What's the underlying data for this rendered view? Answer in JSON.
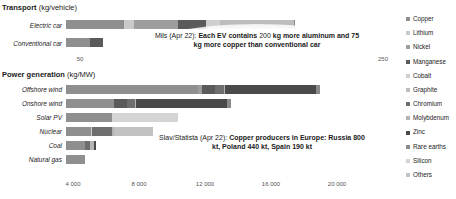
{
  "transport": {
    "title": "Transport",
    "unit": "(kg/vehicle)",
    "categories": [
      "Electric car",
      "Conventional car"
    ],
    "ticks": [
      "50",
      "250"
    ],
    "annotation": {
      "source": "Mils (Apr 22): ",
      "bold1": "Each EV contains ",
      "plain1": "200",
      "bold2": "kg more aluminum and 75 kg more copper than conventional car"
    }
  },
  "power": {
    "title": "Power generation",
    "unit": "(kg/MW)",
    "categories": [
      "Offshore wind",
      "Onshore wind",
      "Solar PV",
      "Nuclear",
      "Coal",
      "Natural gas"
    ],
    "ticks": [
      "4 000",
      "8 000",
      "12 000",
      "16 000",
      "20 000"
    ],
    "annotation": {
      "source": "Slav/Statista (Apr 22): ",
      "bold1": "Copper producers in Europe: Russia 800 kt, Poland 440 kt, Spain 190 kt"
    }
  },
  "legend": {
    "items": [
      {
        "label": "Copper",
        "color": "#8f8f8f"
      },
      {
        "label": "Lithium",
        "color": "#c9c9c9"
      },
      {
        "label": "Nickel",
        "color": "#9d9d9d"
      },
      {
        "label": "Manganese",
        "color": "#5a5a5a"
      },
      {
        "label": "Cobalt",
        "color": "#cfcfcf"
      },
      {
        "label": "Graphite",
        "color": "#bdbdbd"
      },
      {
        "label": "Chromium",
        "color": "#6e6e6e"
      },
      {
        "label": "Molybdenum",
        "color": "#b4b4b4"
      },
      {
        "label": "Zinc",
        "color": "#4a4a4a"
      },
      {
        "label": "Rare earths",
        "color": "#8a8a8a"
      },
      {
        "label": "Silicon",
        "color": "#d4d4d4"
      },
      {
        "label": "Others",
        "color": "#c2c2c2"
      }
    ]
  },
  "chart_data": {
    "type": "bar",
    "subtype": "stacked-horizontal",
    "grid": false,
    "legend_position": "right",
    "series_names": [
      "Copper",
      "Lithium",
      "Nickel",
      "Manganese",
      "Cobalt",
      "Graphite",
      "Chromium",
      "Molybdenum",
      "Zinc",
      "Rare earths",
      "Silicon",
      "Others"
    ],
    "panels": [
      {
        "title": "Transport",
        "ylabel": "",
        "xlabel": "kg/vehicle",
        "xlim": [
          0,
          300
        ],
        "xticks": [
          50,
          250
        ],
        "categories": [
          "Electric car",
          "Conventional car"
        ],
        "rows": [
          {
            "category": "Electric car",
            "total": 208,
            "segments": [
              {
                "name": "Copper",
                "value": 53
              },
              {
                "name": "Lithium",
                "value": 9
              },
              {
                "name": "Nickel",
                "value": 40
              },
              {
                "name": "Manganese",
                "value": 25
              },
              {
                "name": "Cobalt",
                "value": 13
              },
              {
                "name": "Graphite",
                "value": 67
              },
              {
                "name": "Rare earths",
                "value": 1
              }
            ]
          },
          {
            "category": "Conventional car",
            "total": 34,
            "segments": [
              {
                "name": "Copper",
                "value": 22
              },
              {
                "name": "Manganese",
                "value": 12
              }
            ]
          }
        ]
      },
      {
        "title": "Power generation",
        "ylabel": "",
        "xlabel": "kg/MW",
        "xlim": [
          0,
          20000
        ],
        "xticks": [
          4000,
          8000,
          12000,
          16000,
          20000
        ],
        "categories": [
          "Offshore wind",
          "Onshore wind",
          "Solar PV",
          "Nuclear",
          "Coal",
          "Natural gas"
        ],
        "rows": [
          {
            "category": "Offshore wind",
            "total": 15400,
            "segments": [
              {
                "name": "Copper",
                "value": 8000
              },
              {
                "name": "Nickel",
                "value": 240
              },
              {
                "name": "Manganese",
                "value": 790
              },
              {
                "name": "Chromium",
                "value": 525
              },
              {
                "name": "Molybdenum",
                "value": 109
              },
              {
                "name": "Zinc",
                "value": 5500
              },
              {
                "name": "Rare earths",
                "value": 239
              }
            ]
          },
          {
            "category": "Onshore wind",
            "total": 10100,
            "segments": [
              {
                "name": "Copper",
                "value": 2900
              },
              {
                "name": "Manganese",
                "value": 800
              },
              {
                "name": "Chromium",
                "value": 470
              },
              {
                "name": "Molybdenum",
                "value": 99
              },
              {
                "name": "Zinc",
                "value": 5500
              },
              {
                "name": "Rare earths",
                "value": 240
              }
            ]
          },
          {
            "category": "Solar PV",
            "total": 6800,
            "segments": [
              {
                "name": "Copper",
                "value": 2800
              },
              {
                "name": "Silicon",
                "value": 4000
              }
            ]
          },
          {
            "category": "Nuclear",
            "total": 5300,
            "segments": [
              {
                "name": "Copper",
                "value": 1500
              },
              {
                "name": "Cobalt",
                "value": 100
              },
              {
                "name": "Chromium",
                "value": 1200
              },
              {
                "name": "Molybdenum",
                "value": 100
              },
              {
                "name": "Others",
                "value": 2400
              }
            ]
          },
          {
            "category": "Coal",
            "total": 2100,
            "segments": [
              {
                "name": "Copper",
                "value": 1150
              },
              {
                "name": "Chromium",
                "value": 330
              },
              {
                "name": "Molybdenum",
                "value": 200
              },
              {
                "name": "Zinc",
                "value": 130
              }
            ]
          },
          {
            "category": "Natural gas",
            "total": 1150,
            "segments": [
              {
                "name": "Copper",
                "value": 1150
              }
            ]
          }
        ]
      }
    ]
  }
}
